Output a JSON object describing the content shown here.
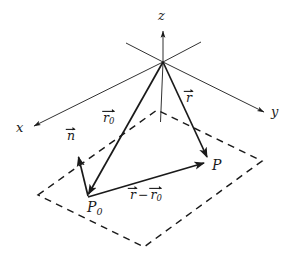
{
  "figure": {
    "width": 297,
    "height": 266,
    "background_color": "#ffffff",
    "stroke_color": "#1a1a1a",
    "labels": {
      "axis_x": "x",
      "axis_y": "y",
      "axis_z": "z",
      "point_p": "P",
      "point_p0_symbol": "P",
      "point_p0_subscript": "0",
      "vector_r": "r",
      "vector_r0_symbol": "r",
      "vector_r0_subscript": "0",
      "vector_n": "n",
      "vector_difference_minuend": "r",
      "vector_difference_operator": "−",
      "vector_difference_subtrahend": "r",
      "vector_difference_subtrahend_subscript": "0"
    }
  },
  "geometry": {
    "origin": {
      "x": 163,
      "y": 62
    },
    "axes": [
      {
        "name": "z-axis",
        "from": {
          "x": 163,
          "y": 62
        },
        "to": {
          "x": 163,
          "y": 30
        },
        "arrow": true
      },
      {
        "name": "z-axis-below",
        "from": {
          "x": 163,
          "y": 62
        },
        "to": {
          "x": 160,
          "y": 122
        },
        "arrow": false
      },
      {
        "name": "x-axis",
        "from": {
          "x": 163,
          "y": 62
        },
        "to": {
          "x": 33,
          "y": 126
        },
        "arrow": true
      },
      {
        "name": "x-axis-negative",
        "from": {
          "x": 163,
          "y": 62
        },
        "to": {
          "x": 201,
          "y": 42
        },
        "arrow": false
      },
      {
        "name": "y-axis",
        "from": {
          "x": 163,
          "y": 62
        },
        "to": {
          "x": 265,
          "y": 112
        },
        "arrow": true
      },
      {
        "name": "y-axis-negative",
        "from": {
          "x": 163,
          "y": 62
        },
        "to": {
          "x": 126,
          "y": 43
        },
        "arrow": false
      }
    ],
    "plane_corners": [
      {
        "name": "left",
        "x": 38,
        "y": 195
      },
      {
        "name": "top",
        "x": 157,
        "y": 110
      },
      {
        "name": "right",
        "x": 262,
        "y": 161
      },
      {
        "name": "bottom",
        "x": 144,
        "y": 247
      }
    ],
    "vectors": [
      {
        "name": "r0",
        "from": {
          "x": 163,
          "y": 62
        },
        "to": {
          "x": 87,
          "y": 197
        }
      },
      {
        "name": "r",
        "from": {
          "x": 163,
          "y": 62
        },
        "to": {
          "x": 208,
          "y": 160
        }
      },
      {
        "name": "r-minus-r0",
        "from": {
          "x": 87,
          "y": 197
        },
        "to": {
          "x": 207,
          "y": 162
        }
      },
      {
        "name": "n",
        "from": {
          "x": 88,
          "y": 196
        },
        "to": {
          "x": 78,
          "y": 154
        }
      }
    ],
    "points": [
      {
        "name": "P0",
        "x": 87,
        "y": 197
      },
      {
        "name": "P",
        "x": 208,
        "y": 160
      }
    ],
    "label_positions": {
      "axis_x": {
        "x": 16,
        "y": 121
      },
      "axis_y": {
        "x": 271,
        "y": 105
      },
      "axis_z": {
        "x": 158,
        "y": 9
      },
      "point_p": {
        "x": 212,
        "y": 158
      },
      "point_p0": {
        "x": 87,
        "y": 200
      },
      "vector_r": {
        "x": 186,
        "y": 88
      },
      "vector_r0": {
        "x": 103,
        "y": 108
      },
      "vector_n": {
        "x": 67,
        "y": 126
      },
      "vector_difference": {
        "x": 130,
        "y": 185
      }
    }
  }
}
